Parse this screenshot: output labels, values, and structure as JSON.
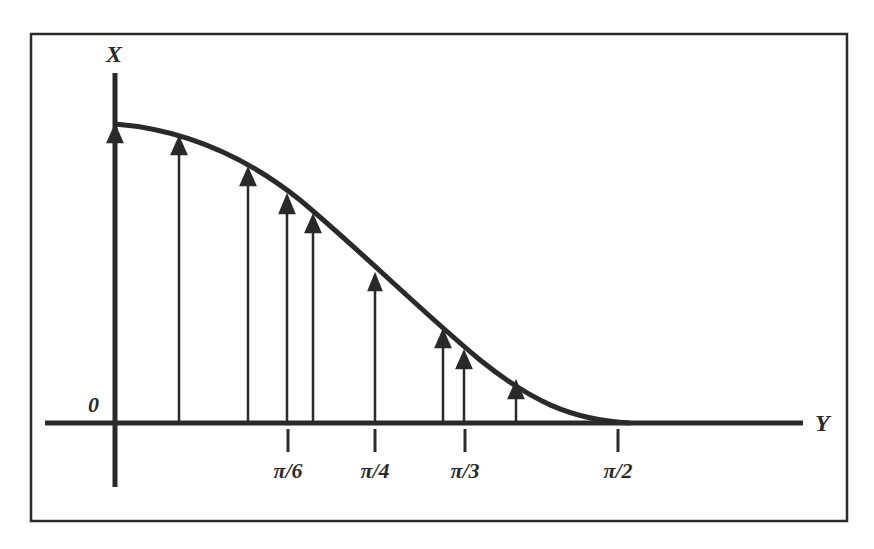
{
  "figure": {
    "frame": {
      "x": 30,
      "y": 33,
      "width": 818,
      "height": 489
    },
    "colors": {
      "ink": "#2a2a2a",
      "background": "#ffffff"
    },
    "axes": {
      "vertical_label": "X",
      "horizontal_label": "Y",
      "origin_label": "0"
    },
    "ticks": [
      {
        "label": "π/6",
        "x": 288
      },
      {
        "label": "π/4",
        "x": 375
      },
      {
        "label": "π/3",
        "x": 465
      },
      {
        "label": "π/2",
        "x": 618
      }
    ],
    "curve": {
      "description": "smooth decreasing curve from top of vertical axis to horizontal axis at π/2",
      "start": [
        115,
        124
      ],
      "end": [
        620,
        423
      ]
    },
    "arrows_x": [
      115,
      179,
      248,
      287,
      313,
      375,
      443,
      464,
      516
    ]
  }
}
